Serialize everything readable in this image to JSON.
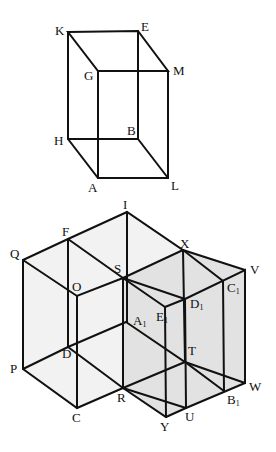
{
  "figure_top": {
    "name": "rectangular prism",
    "labels": [
      "K",
      "E",
      "G",
      "M",
      "H",
      "B",
      "A",
      "L"
    ]
  },
  "figure_bottom": {
    "name": "combined prisms",
    "labels": [
      "I",
      "F",
      "Q",
      "X",
      "S",
      "V",
      "O",
      "C1",
      "D1",
      "E1",
      "A1",
      "T",
      "D",
      "P",
      "W",
      "R",
      "B1",
      "C",
      "U",
      "Y"
    ],
    "shade_color": "#e2e2e2",
    "light_shade_color": "#f1f1f1"
  },
  "labels": {
    "K": "K",
    "E": "E",
    "G": "G",
    "M": "M",
    "H": "H",
    "B": "B",
    "A": "A",
    "L": "L",
    "I": "I",
    "F": "F",
    "Q": "Q",
    "X": "X",
    "S": "S",
    "V": "V",
    "O": "O",
    "C1": "C",
    "D1": "D",
    "E1": "E",
    "A1": "A",
    "B1": "B",
    "T": "T",
    "D": "D",
    "P": "P",
    "W": "W",
    "R": "R",
    "C": "C",
    "U": "U",
    "Y": "Y",
    "sub1": "1"
  }
}
